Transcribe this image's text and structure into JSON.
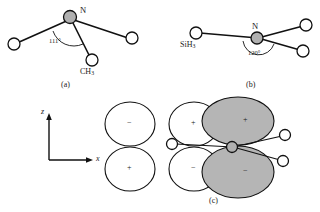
{
  "figure": {
    "background_color": "#ffffff",
    "line_color": "#111111",
    "shaded_fill": "#b3b3b3",
    "open_fill": "#ffffff"
  },
  "panels": [
    {
      "id": "a",
      "label": "(a)",
      "center_atom_label": "N",
      "angle_label": "111°",
      "substituent_label": "CH",
      "substituent_sub": "3",
      "geometry": "pyramidal"
    },
    {
      "id": "b",
      "label": "(b)",
      "center_atom_label": "N",
      "angle_label": "120°",
      "substituent_label": "SiH",
      "substituent_sub": "3",
      "geometry": "planar"
    },
    {
      "id": "c",
      "label": "(c)",
      "geometry": "orbital-overlap"
    }
  ],
  "axes": {
    "vertical_label": "z",
    "horizontal_label": "x"
  },
  "orbitals": [
    {
      "id": "left-top",
      "sign": "−",
      "shaded": false
    },
    {
      "id": "left-bottom",
      "sign": "+",
      "shaded": false
    },
    {
      "id": "mid-top",
      "sign": "+",
      "shaded": false
    },
    {
      "id": "mid-bottom",
      "sign": "−",
      "shaded": false
    },
    {
      "id": "right-top",
      "sign": "+",
      "shaded": true
    },
    {
      "id": "right-bottom",
      "sign": "−",
      "shaded": true
    }
  ]
}
